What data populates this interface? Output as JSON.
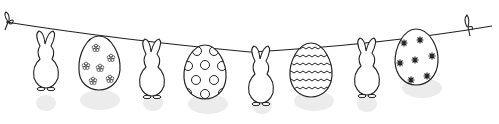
{
  "scene": {
    "description": "Easter garland of hanging bunnies and decorated eggs on a string",
    "stroke_color": "#222222",
    "fill_color": "#ffffff",
    "shadow_color": "#e6e6e6",
    "items": [
      {
        "type": "bunny",
        "x": 46
      },
      {
        "type": "egg",
        "pattern": "flowers",
        "x": 99
      },
      {
        "type": "bunny",
        "x": 152
      },
      {
        "type": "egg",
        "pattern": "dots",
        "x": 205
      },
      {
        "type": "bunny",
        "x": 258
      },
      {
        "type": "egg",
        "pattern": "zigzag",
        "x": 311
      },
      {
        "type": "bunny",
        "x": 364
      },
      {
        "type": "egg",
        "pattern": "stars",
        "x": 417
      }
    ]
  }
}
